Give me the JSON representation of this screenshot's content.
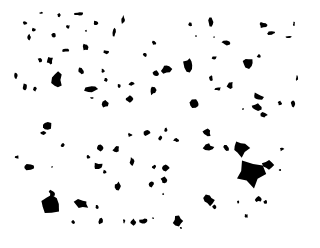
{
  "image": {
    "width": 320,
    "height": 248,
    "background": "#ffffff",
    "foreground": "#000000",
    "description": "Binary pattern of scattered irregular black blobs on white"
  },
  "blobs": [
    [
      41,
      13,
      2,
      1
    ],
    [
      59,
      15,
      2,
      2
    ],
    [
      79,
      14,
      4,
      2
    ],
    [
      96,
      23,
      3,
      2
    ],
    [
      123,
      20,
      2,
      4
    ],
    [
      25,
      23,
      2,
      2
    ],
    [
      34,
      30,
      2,
      2
    ],
    [
      29,
      37,
      2,
      3
    ],
    [
      54,
      35,
      2,
      2
    ],
    [
      68,
      27,
      2,
      2
    ],
    [
      86,
      31,
      1,
      1
    ],
    [
      114,
      32,
      2,
      4
    ],
    [
      65,
      50,
      4,
      2
    ],
    [
      85,
      47,
      3,
      4
    ],
    [
      106,
      52,
      4,
      2
    ],
    [
      50,
      61,
      3,
      4
    ],
    [
      40,
      60,
      2,
      3
    ],
    [
      16,
      76,
      2,
      3
    ],
    [
      57,
      80,
      5,
      7
    ],
    [
      25,
      87,
      2,
      3
    ],
    [
      35,
      89,
      2,
      2
    ],
    [
      81,
      71,
      3,
      3
    ],
    [
      103,
      71,
      2,
      2
    ],
    [
      106,
      80,
      2,
      2
    ],
    [
      91,
      89,
      6,
      4
    ],
    [
      119,
      86,
      2,
      2
    ],
    [
      131,
      84,
      3,
      2
    ],
    [
      92,
      98,
      2,
      1
    ],
    [
      105,
      103,
      3,
      4
    ],
    [
      129,
      99,
      4,
      3
    ],
    [
      154,
      43,
      2,
      2
    ],
    [
      145,
      55,
      2,
      2
    ],
    [
      156,
      74,
      3,
      3
    ],
    [
      153,
      90,
      3,
      5
    ],
    [
      190,
      24,
      2,
      2
    ],
    [
      211,
      22,
      3,
      5
    ],
    [
      214,
      37,
      1,
      1
    ],
    [
      226,
      43,
      4,
      2
    ],
    [
      196,
      36,
      1,
      1
    ],
    [
      166,
      69,
      5,
      5
    ],
    [
      189,
      65,
      5,
      8
    ],
    [
      214,
      58,
      3,
      2
    ],
    [
      248,
      63,
      5,
      5
    ],
    [
      259,
      56,
      2,
      2
    ],
    [
      263,
      25,
      4,
      3
    ],
    [
      271,
      33,
      5,
      2
    ],
    [
      294,
      24,
      1,
      2
    ],
    [
      289,
      37,
      3,
      1
    ],
    [
      211,
      78,
      2,
      3
    ],
    [
      218,
      89,
      3,
      2
    ],
    [
      230,
      85,
      3,
      4
    ],
    [
      258,
      97,
      5,
      4
    ],
    [
      257,
      107,
      6,
      4
    ],
    [
      280,
      103,
      2,
      2
    ],
    [
      195,
      104,
      5,
      4
    ],
    [
      243,
      109,
      1,
      1
    ],
    [
      264,
      115,
      3,
      3
    ],
    [
      293,
      104,
      2,
      3
    ],
    [
      297,
      78,
      1,
      3
    ],
    [
      47,
      126,
      6,
      5
    ],
    [
      43,
      133,
      4,
      2
    ],
    [
      63,
      145,
      2,
      2
    ],
    [
      88,
      157,
      2,
      2
    ],
    [
      100,
      148,
      3,
      3
    ],
    [
      116,
      149,
      3,
      3
    ],
    [
      130,
      135,
      2,
      2
    ],
    [
      147,
      133,
      3,
      3
    ],
    [
      17,
      157,
      2,
      2
    ],
    [
      30,
      167,
      6,
      3
    ],
    [
      52,
      167,
      1,
      1
    ],
    [
      98,
      166,
      5,
      3
    ],
    [
      105,
      172,
      2,
      2
    ],
    [
      118,
      186,
      3,
      4
    ],
    [
      132,
      161,
      2,
      4
    ],
    [
      151,
      184,
      3,
      3
    ],
    [
      164,
      180,
      3,
      3
    ],
    [
      154,
      167,
      2,
      2
    ],
    [
      50,
      204,
      10,
      10
    ],
    [
      52,
      193,
      3,
      3
    ],
    [
      82,
      204,
      7,
      5
    ],
    [
      97,
      207,
      2,
      2
    ],
    [
      73,
      222,
      2,
      2
    ],
    [
      101,
      221,
      3,
      3
    ],
    [
      124,
      221,
      1,
      2
    ],
    [
      133,
      222,
      3,
      3
    ],
    [
      144,
      221,
      4,
      3
    ],
    [
      166,
      130,
      2,
      2
    ],
    [
      176,
      140,
      3,
      2
    ],
    [
      160,
      138,
      2,
      2
    ],
    [
      165,
      168,
      4,
      3
    ],
    [
      207,
      133,
      4,
      4
    ],
    [
      208,
      147,
      5,
      3
    ],
    [
      226,
      148,
      3,
      3
    ],
    [
      240,
      148,
      8,
      8
    ],
    [
      251,
      174,
      14,
      12
    ],
    [
      268,
      165,
      5,
      4
    ],
    [
      282,
      149,
      2,
      2
    ],
    [
      280,
      170,
      1,
      1
    ],
    [
      258,
      199,
      3,
      3
    ],
    [
      265,
      202,
      2,
      2
    ],
    [
      238,
      202,
      1,
      2
    ],
    [
      246,
      216,
      2,
      2
    ],
    [
      209,
      200,
      5,
      5
    ],
    [
      214,
      207,
      2,
      2
    ],
    [
      178,
      221,
      5,
      5
    ],
    [
      181,
      228,
      1,
      1
    ],
    [
      153,
      218,
      1,
      1
    ],
    [
      163,
      194,
      1,
      1
    ]
  ]
}
